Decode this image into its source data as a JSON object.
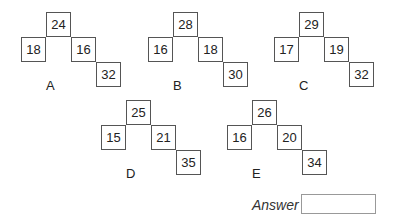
{
  "puzzles": [
    {
      "label": "A",
      "top": "24",
      "left": "18",
      "right": "16",
      "bottom": "32"
    },
    {
      "label": "B",
      "top": "28",
      "left": "16",
      "right": "18",
      "bottom": "30"
    },
    {
      "label": "C",
      "top": "29",
      "left": "17",
      "right": "19",
      "bottom": "32"
    },
    {
      "label": "D",
      "top": "25",
      "left": "15",
      "right": "21",
      "bottom": "35"
    },
    {
      "label": "E",
      "top": "26",
      "left": "16",
      "right": "20",
      "bottom": "34"
    }
  ],
  "answer": {
    "label": "Answer",
    "value": ""
  }
}
